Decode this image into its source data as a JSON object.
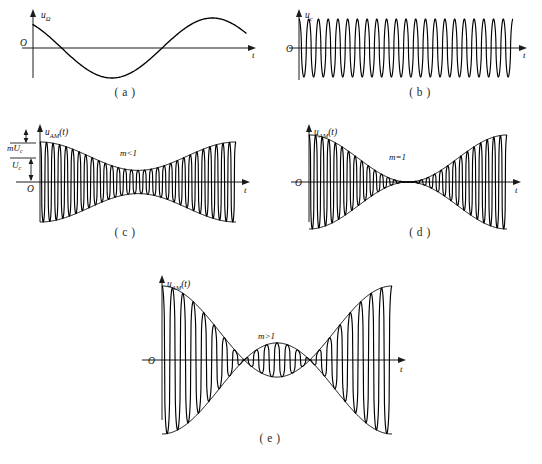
{
  "figure": {
    "title_visible": false,
    "background": "#ffffff",
    "ink": "#000000"
  },
  "panels": [
    {
      "id": "a",
      "caption": "( a )",
      "y_axis_label": "u",
      "y_axis_sub": "Ω",
      "x_axis_label": "t",
      "origin_label": "O",
      "annotation": "",
      "description": "modulating-signal"
    },
    {
      "id": "b",
      "caption": "( b )",
      "y_axis_label": "u",
      "y_axis_sub": "c",
      "x_axis_label": "t",
      "origin_label": "O",
      "annotation": "",
      "description": "carrier-signal"
    },
    {
      "id": "c",
      "caption": "( c )",
      "y_axis_label": "u",
      "y_axis_sub": "AM",
      "y_axis_suffix": "(t)",
      "x_axis_label": "t",
      "origin_label": "O",
      "annotation": "m<1",
      "level_labels": [
        {
          "text": "mU",
          "sub": "c"
        },
        {
          "text": "U",
          "sub": "c"
        }
      ],
      "description": "am-under-modulated"
    },
    {
      "id": "d",
      "caption": "( d )",
      "y_axis_label": "u",
      "y_axis_sub": "AM",
      "y_axis_suffix": "(t)",
      "x_axis_label": "t",
      "origin_label": "O",
      "annotation": "m=1",
      "description": "am-full-modulation"
    },
    {
      "id": "e",
      "caption": "( e )",
      "y_axis_label": "u",
      "y_axis_sub": "AM",
      "y_axis_suffix": "(t)",
      "x_axis_label": "t",
      "origin_label": "O",
      "annotation": "m>1",
      "description": "am-over-modulated"
    }
  ],
  "chart_data": [
    {
      "type": "line",
      "panel": "a",
      "title": "",
      "xlabel": "t",
      "ylabel": "uΩ",
      "grid": false,
      "legend": "none",
      "xlim": [
        0,
        1.08
      ],
      "ylim": [
        -1.25,
        1.25
      ],
      "series": [
        {
          "name": "modulating signal",
          "formula": "cos(2*pi*t)",
          "cycles": 1.0,
          "amplitude": 1.0,
          "phase_deg": 0,
          "start_value": 0.78,
          "x": [
            0,
            0.05,
            0.1,
            0.15,
            0.2,
            0.25,
            0.3,
            0.35,
            0.4,
            0.45,
            0.5,
            0.55,
            0.6,
            0.65,
            0.7,
            0.75,
            0.8,
            0.85,
            0.9,
            0.95,
            1.0
          ],
          "values": [
            0.78,
            0.72,
            0.6,
            0.42,
            0.2,
            -0.03,
            -0.28,
            -0.5,
            -0.7,
            -0.85,
            -0.95,
            -1.0,
            -0.97,
            -0.88,
            -0.73,
            -0.53,
            -0.3,
            -0.06,
            0.2,
            0.44,
            0.64
          ]
        }
      ]
    },
    {
      "type": "line",
      "panel": "b",
      "title": "",
      "xlabel": "t",
      "ylabel": "uc",
      "grid": false,
      "legend": "none",
      "xlim": [
        0,
        1.0
      ],
      "ylim": [
        -1.25,
        1.25
      ],
      "series": [
        {
          "name": "carrier",
          "formula": "cos(2*pi*N*t)",
          "cycles": 22,
          "amplitude": 1.0,
          "phase_deg": 0
        }
      ]
    },
    {
      "type": "line",
      "panel": "c",
      "title": "",
      "xlabel": "t",
      "ylabel": "uAM(t)",
      "grid": false,
      "legend": "none",
      "annotation": "m<1",
      "xlim": [
        0,
        1.0
      ],
      "ylim": [
        -1.3,
        1.3
      ],
      "modulation_index": 0.55,
      "series": [
        {
          "name": "AM waveform",
          "formula": "(1 + m*cos(2*pi*t)) * cos(2*pi*N*t)",
          "carrier_cycles": 30,
          "modulating_cycles": 1,
          "carrier_amplitude": 1.0,
          "m": 0.55
        },
        {
          "name": "upper envelope",
          "formula": "1 + m*cos(2*pi*t)",
          "m": 0.55
        },
        {
          "name": "lower envelope",
          "formula": "-(1 + m*cos(2*pi*t))",
          "m": 0.55
        }
      ],
      "y_marks": [
        {
          "label": "mUc",
          "value": 1.55
        },
        {
          "label": "Uc",
          "value": 1.0
        }
      ]
    },
    {
      "type": "line",
      "panel": "d",
      "title": "",
      "xlabel": "t",
      "ylabel": "uAM(t)",
      "grid": false,
      "legend": "none",
      "annotation": "m=1",
      "xlim": [
        0,
        1.0
      ],
      "ylim": [
        -1.3,
        1.3
      ],
      "modulation_index": 1.0,
      "series": [
        {
          "name": "AM waveform",
          "formula": "(1 + m*cos(2*pi*t)) * cos(2*pi*N*t)",
          "carrier_cycles": 30,
          "modulating_cycles": 1,
          "carrier_amplitude": 1.0,
          "m": 1.0
        },
        {
          "name": "upper envelope",
          "formula": "1 + m*cos(2*pi*t)",
          "m": 1.0
        },
        {
          "name": "lower envelope",
          "formula": "-(1 + m*cos(2*pi*t))",
          "m": 1.0
        }
      ]
    },
    {
      "type": "line",
      "panel": "e",
      "title": "",
      "xlabel": "t",
      "ylabel": "uAM(t)",
      "grid": false,
      "legend": "none",
      "annotation": "m>1",
      "xlim": [
        0,
        1.0
      ],
      "ylim": [
        -1.6,
        1.6
      ],
      "modulation_index": 1.6,
      "series": [
        {
          "name": "AM waveform (over-modulated, clipped)",
          "formula": "(1 + m*cos(2*pi*t)) * cos(2*pi*N*t) clipped at zero",
          "carrier_cycles": 22,
          "modulating_cycles": 1,
          "carrier_amplitude": 1.0,
          "m": 1.6,
          "dead_zone": true
        },
        {
          "name": "upper envelope",
          "formula": "|1 + m*cos(2*pi*t)|",
          "m": 1.6
        },
        {
          "name": "lower envelope",
          "formula": "-|1 + m*cos(2*pi*t)|",
          "m": 1.6
        }
      ]
    }
  ]
}
